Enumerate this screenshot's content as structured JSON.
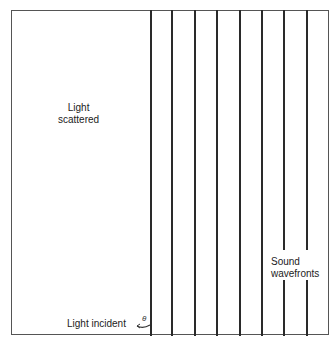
{
  "diagram": {
    "labels": {
      "scattered_line1": "Light",
      "scattered_line2": "scattered",
      "sound_line1": "Sound",
      "sound_line2": "wavefronts",
      "incident": "Light incident",
      "angle": "θ"
    },
    "wavefront_count": 8,
    "colors": {
      "line": "#2a2a2a",
      "frame": "#555555",
      "background": "#ffffff"
    }
  }
}
